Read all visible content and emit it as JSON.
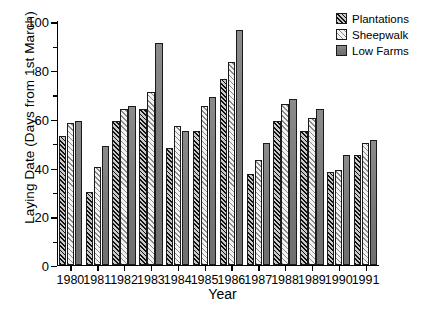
{
  "chart_data": {
    "type": "bar",
    "title": "",
    "xlabel": "Year",
    "ylabel": "Laying Date (Days from 1st March)",
    "categories": [
      "1980",
      "1981",
      "1982",
      "1983",
      "1984",
      "1985",
      "1986",
      "1987",
      "1988",
      "1989",
      "1990",
      "1991"
    ],
    "series": [
      {
        "name": "Plantations",
        "values": [
          53,
          30,
          59,
          64,
          48,
          55,
          76,
          37,
          59,
          55,
          38,
          45
        ]
      },
      {
        "name": "Sheepwalk",
        "values": [
          58,
          40,
          64,
          71,
          57,
          65,
          83,
          43,
          66,
          60,
          39,
          50
        ]
      },
      {
        "name": "Low Farms",
        "values": [
          59,
          48.5,
          65,
          91,
          55,
          69,
          96.5,
          50,
          68,
          64,
          45,
          51
        ]
      }
    ],
    "ylim": [
      0,
      100
    ],
    "yticks": [
      0,
      20,
      40,
      60,
      80,
      100
    ],
    "yticks_minor": [
      10,
      30,
      50,
      70,
      90
    ],
    "grid": false,
    "legend_position": "top-right",
    "colors": {
      "plantations": "#4a4a4a",
      "sheepwalk": "#e8e8e8",
      "low_farms": "#7d7d7d",
      "axis": "#000000",
      "background": "#ffffff"
    }
  },
  "legend": {
    "items": [
      {
        "label": "Plantations",
        "pattern": "dark-diagonal-hatch"
      },
      {
        "label": "Sheepwalk",
        "pattern": "light-diagonal-hatch"
      },
      {
        "label": "Low Farms",
        "pattern": "solid-gray"
      }
    ]
  }
}
